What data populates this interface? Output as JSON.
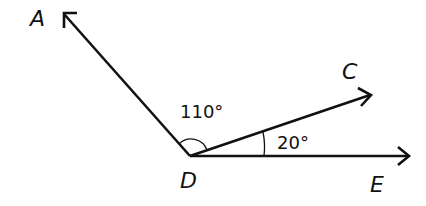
{
  "diagram": {
    "points": {
      "A": {
        "label": "A"
      },
      "C": {
        "label": "C"
      },
      "D": {
        "label": "D"
      },
      "E": {
        "label": "E"
      }
    },
    "angles": [
      {
        "name": "ADC",
        "label": "110°",
        "value": 110
      },
      {
        "name": "CDE",
        "label": "20°",
        "value": 20
      }
    ],
    "rays": [
      "DA",
      "DC",
      "DE"
    ],
    "colors": {
      "stroke": "#111111",
      "background": "#ffffff"
    }
  }
}
